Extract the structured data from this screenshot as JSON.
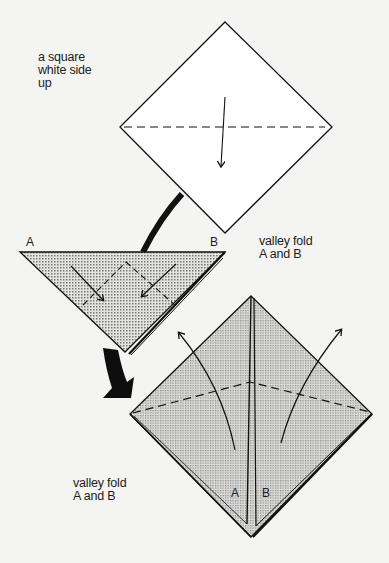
{
  "diagram": {
    "type": "origami-instructions",
    "background": "#f4f4f2",
    "line_color": "#111111",
    "shade_color": "#c8c8c8",
    "steps": [
      {
        "id": 1,
        "shape": "diamond",
        "fill": "white",
        "caption_lines": [
          "a square",
          "white side",
          "up"
        ],
        "fold_line": "valley (dashed, horizontal)",
        "arrow": "down"
      },
      {
        "id": 2,
        "shape": "triangle",
        "fill": "shaded",
        "corner_labels": [
          "A",
          "B"
        ],
        "caption_lines": [
          "valley fold",
          "A and B"
        ],
        "arrows": [
          "A toward center",
          "B toward center"
        ]
      },
      {
        "id": 3,
        "shape": "diamond",
        "fill": "shaded",
        "flap_labels": [
          "A",
          "B"
        ],
        "caption_lines": [
          "valley fold",
          "A and B"
        ],
        "fold_line": "valley (dashed, peaked)",
        "arrows": [
          "A up-left",
          "B up-right"
        ]
      }
    ],
    "transition_arrows": [
      "step1-to-step2",
      "step2-to-step3"
    ]
  },
  "step1": {
    "caption": [
      "a square",
      "white side",
      "up"
    ]
  },
  "step2": {
    "corner_a": "A",
    "corner_b": "B",
    "caption": [
      "valley fold",
      "A and B"
    ]
  },
  "step3": {
    "flap_a": "A",
    "flap_b": "B",
    "caption": [
      "valley fold",
      "A and B"
    ]
  }
}
